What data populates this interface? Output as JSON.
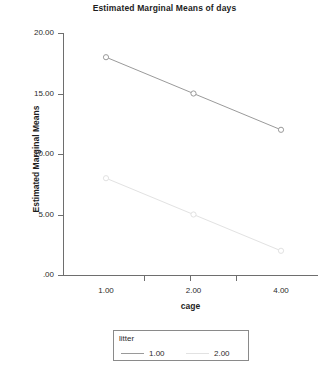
{
  "chart_data": {
    "type": "line",
    "title": "Estimated Marginal Means of days",
    "xlabel": "cage",
    "ylabel": "Estimated Marginal Means",
    "x": [
      1.0,
      2.0,
      4.0
    ],
    "xtick_labels": [
      "1.00",
      "2.00",
      "4.00"
    ],
    "ytick_labels": [
      ".00",
      "5.00",
      "10.00",
      "15.00",
      "20.00"
    ],
    "ytick_values": [
      0,
      5,
      10,
      15,
      20
    ],
    "ylim": [
      0,
      20
    ],
    "grid": false,
    "legend_position": "below-axis",
    "legend_title": "litter",
    "markers": "open-circle",
    "series": [
      {
        "name": "1.00",
        "values": [
          18.0,
          15.0,
          12.0
        ],
        "color": "#9a9a9a"
      },
      {
        "name": "2.00",
        "values": [
          8.0,
          5.0,
          2.0
        ],
        "color": "#e2e2e2"
      }
    ]
  },
  "figure": {
    "caption": ""
  },
  "colors": {
    "axis": "#6e6e6e",
    "text": "#2b2b2b",
    "series_1": "#9a9a9a",
    "series_2": "#e2e2e2"
  }
}
